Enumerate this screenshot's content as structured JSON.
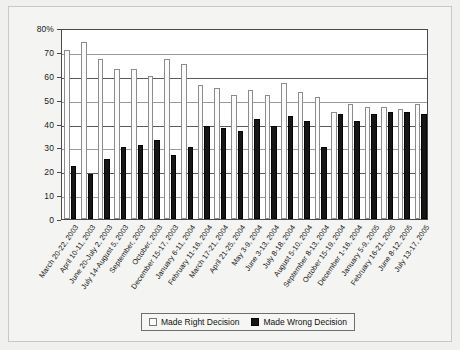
{
  "chart_data": {
    "type": "bar",
    "title": "",
    "xlabel": "",
    "ylabel": "",
    "ylim": [
      0,
      80
    ],
    "yticks": [
      "80%",
      "70",
      "60",
      "50",
      "40",
      "30",
      "20",
      "10",
      "0"
    ],
    "ytick_values": [
      80,
      70,
      60,
      50,
      40,
      30,
      20,
      10,
      0
    ],
    "grid": true,
    "legend_position": "bottom",
    "categories": [
      "March 20-22, 2003",
      "April 10-11, 2003",
      "June 20-July 2, 2003",
      "July 14-August 5, 2003",
      "September, 2003",
      "October, 2003",
      "December 15-17, 2003",
      "January 6-11, 2004",
      "February 11-16, 2004",
      "March 17-21, 2004",
      "April 21-25, 2004",
      "May 3-9, 2004",
      "June 3-13, 2004",
      "July 8-18, 2004",
      "August 5-10, 2004",
      "September 8-13, 2004",
      "October 15-19, 2004",
      "December 1-16, 2004",
      "January 5-9, 2005",
      "February 16-21, 2005",
      "June 8-12, 2005",
      "July 13-17, 2005"
    ],
    "series": [
      {
        "name": "Made Right Decision",
        "color": "#fbfbfb",
        "values": [
          71,
          74,
          67,
          63,
          63,
          60,
          67,
          65,
          56,
          55,
          52,
          54,
          52,
          57,
          53,
          51,
          45,
          48,
          47,
          47,
          46,
          48
        ]
      },
      {
        "name": "Made Wrong Decision",
        "color": "#161616",
        "values": [
          22,
          19,
          25,
          30,
          31,
          33,
          27,
          30,
          39,
          38,
          37,
          42,
          39,
          43,
          41,
          30,
          44,
          41,
          44,
          45,
          45,
          44
        ]
      }
    ]
  },
  "legend": {
    "items": [
      {
        "label": "Made Right Decision",
        "swatch": "light-square-icon"
      },
      {
        "label": "Made Wrong Decision",
        "swatch": "dark-square-icon"
      }
    ]
  }
}
